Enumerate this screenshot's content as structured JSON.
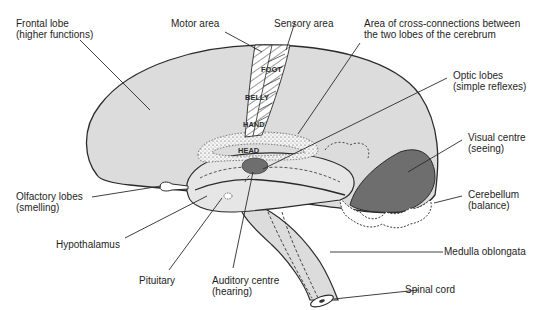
{
  "colors": {
    "brain_fill": "#dcdcdc",
    "outline": "#2a2a2a",
    "dark_region": "#6e6e6e",
    "background": "#ffffff"
  },
  "labels": {
    "frontal_lobe": {
      "line1": "Frontal lobe",
      "line2": "(higher functions)"
    },
    "motor_area": {
      "line1": "Motor area"
    },
    "sensory_area": {
      "line1": "Sensory area"
    },
    "cross_connections": {
      "line1": "Area of cross-connections between",
      "line2": "the two lobes of the cerebrum"
    },
    "optic_lobes": {
      "line1": "Optic lobes",
      "line2": "(simple reflexes)"
    },
    "visual_centre": {
      "line1": "Visual centre",
      "line2": "(seeing)"
    },
    "cerebellum": {
      "line1": "Cerebellum",
      "line2": "(balance)"
    },
    "medulla": {
      "line1": "Medulla oblongata"
    },
    "spinal_cord": {
      "line1": "Spinal cord"
    },
    "olfactory_lobes": {
      "line1": "Olfactory lobes",
      "line2": "(smelling)"
    },
    "hypothalamus": {
      "line1": "Hypothalamus"
    },
    "pituitary": {
      "line1": "Pituitary"
    },
    "auditory_centre": {
      "line1": "Auditory centre",
      "line2": "(hearing)"
    }
  },
  "motor_strip_labels": [
    "FOOT",
    "BELLY",
    "HAND",
    "HEAD"
  ]
}
